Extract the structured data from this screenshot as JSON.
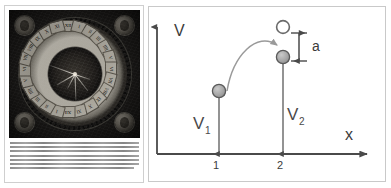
{
  "figure": {
    "left_panel": {
      "name": "engraved-astronomical-clock-plate",
      "image_alt": "Antique engraving of a circular astronomical clock dial with Roman numeral hour plaquettes, a dark center with radiating hands, and four portrait medallions in the corners",
      "dial": {
        "numerals": [
          "XII",
          "I",
          "II",
          "III",
          "IIII",
          "V",
          "VI",
          "VII",
          "VIII",
          "IX",
          "X",
          "XI",
          "XII",
          "I",
          "II",
          "III",
          "IIII",
          "V",
          "VI",
          "VII",
          "VIII",
          "IX",
          "X",
          "XI"
        ],
        "center_style": "dark-disc",
        "hand_count": 6
      },
      "medallions": [
        "corner-portrait-top-left",
        "corner-portrait-top-right",
        "corner-portrait-bottom-left",
        "corner-portrait-bottom-right"
      ],
      "caption_lines": [
        "Figure 1.1 (opposite). A clock face from Italy, an early",
        "astronomical instrument of the kind used through the",
        "sixteenth century. The outer band carries the hours in",
        "Roman numerals, the inner disc shows the motion of the",
        "sun and the moon across the sky, and the four corner",
        "portraits represent the seasons. Such dials combined",
        "timekeeping with astronomy and were widely copied."
      ]
    },
    "right_panel": {
      "name": "potential-vs-position-diagram",
      "axes": {
        "y_label": "V",
        "x_label": "x",
        "x_ticks": [
          "1",
          "2"
        ]
      },
      "arrows": {
        "v1_label": "V",
        "v1_subscript": "1",
        "v2_label": "V",
        "v2_subscript": "2",
        "gap_label": "a"
      },
      "markers": {
        "filled_circle_left": "particle-at-site-1",
        "filled_circle_right": "particle-at-site-2",
        "open_circle": "vacant-level-above-site-2",
        "curved_arrow": "hop-from-site-1-to-site-2"
      },
      "colors": {
        "stroke": "#4a4a4a",
        "filled_marker": "#a8a8a8",
        "marker_edge": "#5a5a5a",
        "curve_arrow": "#9a9a9a",
        "panel_border": "#c9c9c9"
      }
    }
  }
}
